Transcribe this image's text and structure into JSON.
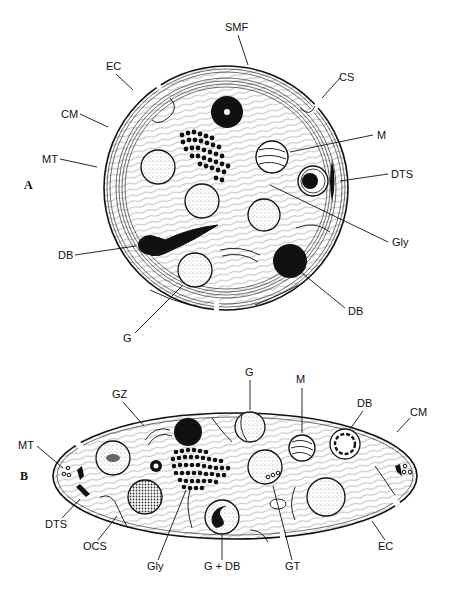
{
  "figure": {
    "panels": [
      {
        "id": "A",
        "label": "A",
        "view": "equatorial cross-section (circular)",
        "labels": {
          "smf": "SMF",
          "ec": "EC",
          "cs": "CS",
          "cm": "CM",
          "m": "M",
          "mt": "MT",
          "dts": "DTS",
          "gly": "Gly",
          "db_left": "DB",
          "db_right": "DB",
          "g": "G"
        }
      },
      {
        "id": "B",
        "label": "B",
        "view": "longitudinal cross-section (elliptical)",
        "labels": {
          "g": "G",
          "m": "M",
          "gz": "GZ",
          "db": "DB",
          "cm": "CM",
          "mt": "MT",
          "dts": "DTS",
          "ocs": "OCS",
          "gly": "Gly",
          "g_db": "G + DB",
          "gt": "GT",
          "ec": "EC"
        }
      }
    ]
  },
  "colors": {
    "ink": "#111111",
    "background": "#ffffff",
    "stipple": "#888888"
  }
}
